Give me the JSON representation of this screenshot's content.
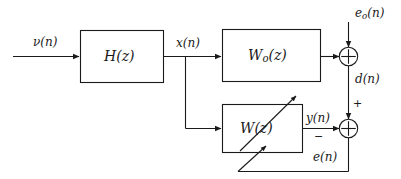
{
  "figure": {
    "type": "block-diagram",
    "background_color": "#ffffff",
    "line_color": "#1a1a1a",
    "text_color": "#1a1a1a"
  },
  "blocks": [
    {
      "id": "h",
      "label_main": "H",
      "label_arg": "(z)",
      "full": "H(z)"
    },
    {
      "id": "wo",
      "label_main": "W",
      "label_sub": "o",
      "label_arg": "(z)",
      "full": "Wo(z)"
    },
    {
      "id": "w",
      "label_main": "W",
      "label_arg": "(z)",
      "full": "W(z)"
    }
  ],
  "signals": {
    "input": {
      "name": "nu-n",
      "main": "ν",
      "arg": "(n)"
    },
    "x": {
      "name": "x-n",
      "main": "x",
      "arg": "(n)"
    },
    "e_optimal": {
      "name": "eo-n",
      "main": "e",
      "sub": "o",
      "arg": "(n)"
    },
    "d": {
      "name": "d-n",
      "main": "d",
      "arg": "(n)"
    },
    "y": {
      "name": "y-n",
      "main": "y",
      "arg": "(n)"
    },
    "e": {
      "name": "e-n",
      "main": "e",
      "arg": "(n)"
    }
  },
  "signs": {
    "plus": "+",
    "minus": "−"
  },
  "junctions": [
    {
      "id": "sum-top",
      "symbol": "circle-plus"
    },
    {
      "id": "sum-bottom",
      "symbol": "circle-plus"
    }
  ]
}
